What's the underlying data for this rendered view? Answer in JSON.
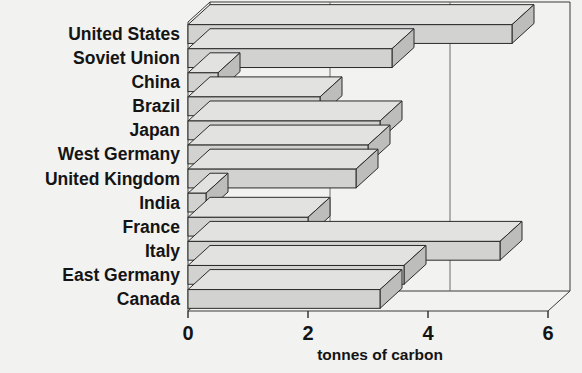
{
  "chart_data": {
    "type": "bar",
    "orientation": "horizontal",
    "style": "3d",
    "title": "",
    "subtitle": "",
    "xlabel": "tonnes of carbon",
    "ylabel": "",
    "xlim": [
      0,
      6
    ],
    "xticks": [
      0,
      2,
      4,
      6
    ],
    "xtick_labels": [
      "0",
      "2",
      "4",
      "6"
    ],
    "grid": true,
    "grid_axis": "x",
    "legend": false,
    "legend_position": "none",
    "categories": [
      "United States",
      "Soviet Union",
      "China",
      "Brazil",
      "Japan",
      "West Germany",
      "United Kingdom",
      "India",
      "France",
      "Italy",
      "East Germany",
      "Canada"
    ],
    "values": [
      5.4,
      3.4,
      0.5,
      2.2,
      3.2,
      3.0,
      2.8,
      0.3,
      2.0,
      5.2,
      3.6,
      3.2
    ],
    "bar_color": "#d2d2d0",
    "bar_edge_color": "#2b2b2b"
  },
  "axis": {
    "x_title": "tonnes of carbon",
    "tick_labels": [
      "0",
      "2",
      "4",
      "6"
    ]
  },
  "category_labels": [
    "United States",
    "Soviet Union",
    "China",
    "Brazil",
    "Japan",
    "West Germany",
    "United Kingdom",
    "India",
    "France",
    "Italy",
    "East Germany",
    "Canada"
  ],
  "colors": {
    "background": "#f2f2f0",
    "bar_top": "#e2e2e0",
    "bar_front": "#d2d2d0",
    "bar_side": "#bdbdbb",
    "text": "#141414",
    "axis": "#2b2b2b"
  }
}
